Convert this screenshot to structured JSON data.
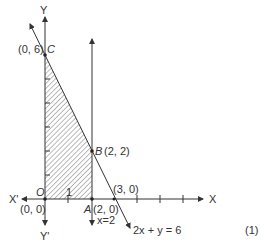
{
  "diagram": {
    "type": "linear-programming-feasible-region",
    "axes": {
      "x_label": "X",
      "x_neg_label": "X'",
      "y_label": "Y",
      "y_neg_label": "Y'",
      "origin_label": "O",
      "origin_coords": "(0, 0)",
      "x_tick_label_1": "1"
    },
    "points": {
      "C": {
        "name": "C",
        "coords": "(0, 6)"
      },
      "B": {
        "name": "B",
        "coords": "(2, 2)"
      },
      "A": {
        "name": "A",
        "coords": "(2, 0)"
      },
      "xint": {
        "coords": "(3, 0)"
      }
    },
    "lines": {
      "vertical": "x=2",
      "oblique": "2x + y = 6"
    },
    "equation_number": "(1)",
    "colors": {
      "stroke": "#333333",
      "hatch": "#555555"
    }
  }
}
